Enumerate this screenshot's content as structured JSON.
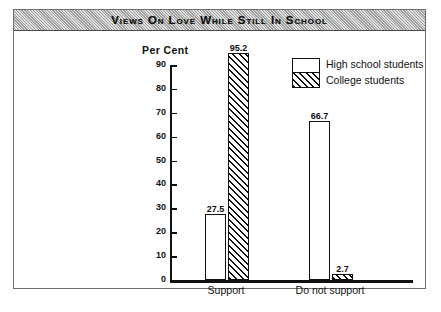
{
  "figure": {
    "title": "Views on Love While Still in School"
  },
  "chart_data": {
    "type": "bar",
    "title": "Views on Love While Still in School",
    "xlabel": "",
    "ylabel": "Per Cent",
    "ylim": [
      0,
      95
    ],
    "yticks": [
      0,
      10,
      20,
      30,
      40,
      50,
      60,
      70,
      80,
      90
    ],
    "ytick_labels": [
      "0",
      "10",
      "20",
      "30",
      "40",
      "50",
      "60",
      "70",
      "80",
      "90"
    ],
    "grid": false,
    "legend_position": "top-right",
    "categories": [
      "Support",
      "Do not support"
    ],
    "series": [
      {
        "name": "High school students",
        "fill": "white",
        "values": [
          27.5,
          66.7
        ],
        "value_labels": [
          "27.5",
          "66.7"
        ]
      },
      {
        "name": "College students",
        "fill": "hatched",
        "values": [
          95.2,
          2.7
        ],
        "value_labels": [
          "95.2",
          "2.7"
        ]
      }
    ]
  },
  "legend": {
    "entries": [
      {
        "label": "High school students",
        "swatch": "white-box-icon"
      },
      {
        "label": "College students",
        "swatch": "hatched-box-icon"
      }
    ]
  },
  "colors": {
    "ink": "#111111",
    "banner": "#b9b9b9",
    "frame": "#6e6e6e",
    "paper": "#ffffff"
  }
}
